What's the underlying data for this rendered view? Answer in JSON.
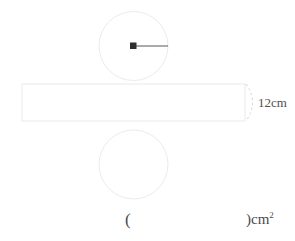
{
  "page": {
    "top_clipped_text": "— —  —   ·   ·   ——  ——   ·",
    "background_color": "#ffffff"
  },
  "figure": {
    "stroke_color": "#e9e9ec",
    "accent_color": "#3a3a3a",
    "dash_color": "#d9d9dd",
    "top_circle": {
      "name": "top-circle",
      "cx": 133.5,
      "cy": 46,
      "r": 34.5,
      "has_center_dot": true,
      "radius_line": {
        "from_x": 133.5,
        "to_x": 168,
        "y": 46
      }
    },
    "bottom_circle": {
      "name": "bottom-circle",
      "cx": 133.5,
      "cy": 164.5,
      "r": 34.5,
      "has_center_dot": false
    },
    "rectangle": {
      "name": "lateral-surface-rectangle",
      "x": 22,
      "y": 84,
      "width": 223,
      "height": 37
    },
    "dimension_brace": {
      "name": "height-brace",
      "label": "12cm",
      "value": 12,
      "unit": "cm",
      "orientation": "vertical-right"
    }
  },
  "answer": {
    "open_paren": "(",
    "close_paren_with_unit": ")cm",
    "unit_exponent": "2"
  }
}
